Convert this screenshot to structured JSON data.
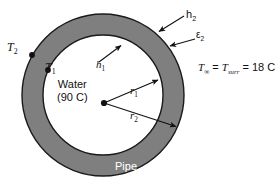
{
  "figure": {
    "type": "cross-section-annulus",
    "colors": {
      "pipe_wall": "#7f7f7f",
      "outline": "#1a1a1a",
      "fluid": "#ffffff",
      "background": "#ffffff",
      "label_text": "#111111",
      "pipe_label_text": "#ffffff"
    },
    "geometry": {
      "center_x": 103,
      "center_y": 95,
      "outer_radius": 81,
      "inner_radius": 60
    }
  },
  "labels": {
    "T2": {
      "base": "T",
      "sub": "2",
      "style": "serif-italic"
    },
    "T1": {
      "base": "T",
      "sub": "1",
      "style": "serif-italic"
    },
    "h1": {
      "base": "h",
      "sub": "1",
      "style": "serif-italic"
    },
    "h2": {
      "base": "h",
      "sub": "2",
      "style": "sans-plain"
    },
    "eps2": {
      "base": "ε",
      "sub": "2",
      "style": "sans-plain"
    },
    "r1": {
      "base": "r",
      "sub": "1",
      "style": "serif-italic"
    },
    "r2": {
      "base": "r",
      "sub": "2",
      "style": "serif-italic"
    },
    "pipe": "Pipe",
    "water_line1": "Water",
    "water_line2": "(90 C)",
    "ambient": {
      "T_base": "T",
      "T_sub": "∞",
      "equals_1": " = ",
      "T2_base": "T",
      "T2_sub": "surr",
      "equals_2": " = 18 C"
    }
  },
  "markers": {
    "center_dot": {
      "x": 104,
      "y": 103,
      "label": "pipe-center-point"
    },
    "T2_dot": {
      "x": 32,
      "y": 55,
      "label": "outer-wall-temperature-point"
    },
    "T1_dot": {
      "x": 48,
      "y": 70,
      "label": "inner-wall-temperature-point"
    }
  },
  "leaders": [
    {
      "name": "h1-leader",
      "from_x": 99,
      "from_y": 62,
      "to_x": 123,
      "to_y": 44
    },
    {
      "name": "h2-leader",
      "from_x": 184,
      "from_y": 16,
      "to_x": 157,
      "to_y": 33
    },
    {
      "name": "eps2-leader",
      "from_x": 195,
      "from_y": 39,
      "to_x": 168,
      "to_y": 47
    },
    {
      "name": "r1-leader",
      "from_x": 104,
      "from_y": 103,
      "to_x": 160,
      "to_y": 79
    },
    {
      "name": "r2-leader",
      "from_x": 104,
      "from_y": 103,
      "to_x": 178,
      "to_y": 128
    }
  ]
}
